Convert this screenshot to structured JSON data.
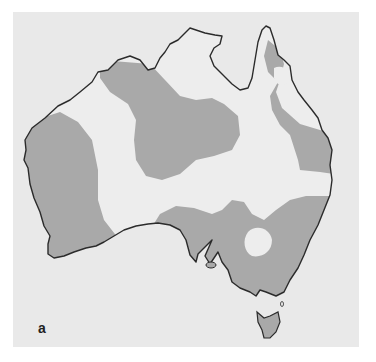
{
  "figure": {
    "panel_label": "a",
    "colors": {
      "page_background": "#ffffff",
      "panel_background": "#e9e9e9",
      "land_unshaded": "#ededed",
      "shaded_region": "#a9a9a9",
      "coastline": "#2b2b2b"
    },
    "regions": [
      {
        "name": "western-shaded-region"
      },
      {
        "name": "central-northern-shaded-region"
      },
      {
        "name": "eastern-coastal-shaded-region"
      },
      {
        "name": "south-eastern-shaded-region"
      },
      {
        "name": "tasmania"
      }
    ]
  }
}
